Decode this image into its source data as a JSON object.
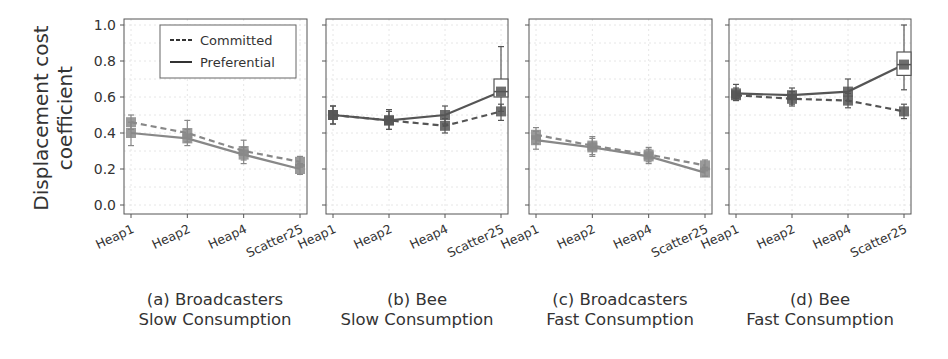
{
  "chart_data": [
    {
      "type": "line",
      "panel": "a",
      "caption_line1": "(a) Broadcasters",
      "caption_line2": "Slow Consumption",
      "categories": [
        "Heap1",
        "Heap2",
        "Heap4",
        "Scatter25"
      ],
      "ylabel": "Displacement cost coefficient",
      "ylim": [
        -0.05,
        1.03
      ],
      "yticks": [
        "0.0",
        "0.2",
        "0.4",
        "0.6",
        "0.8",
        "1.0"
      ],
      "grid": true,
      "legend": {
        "position": "upper right",
        "entries": [
          "Committed",
          "Preferential"
        ]
      },
      "color": "#888888",
      "series": [
        {
          "name": "Committed",
          "style": "dashed",
          "values": [
            0.46,
            0.4,
            0.3,
            0.24
          ],
          "err_low": [
            0.42,
            0.35,
            0.25,
            0.21
          ],
          "err_high": [
            0.5,
            0.47,
            0.36,
            0.27
          ]
        },
        {
          "name": "Preferential",
          "style": "solid",
          "values": [
            0.4,
            0.37,
            0.28,
            0.2
          ],
          "err_low": [
            0.33,
            0.33,
            0.23,
            0.17
          ],
          "err_high": [
            0.46,
            0.42,
            0.32,
            0.23
          ]
        }
      ]
    },
    {
      "type": "line",
      "panel": "b",
      "caption_line1": "(b) Bee",
      "caption_line2": "Slow Consumption",
      "categories": [
        "Heap1",
        "Heap2",
        "Heap4",
        "Scatter25"
      ],
      "ylim": [
        -0.05,
        1.03
      ],
      "grid": true,
      "color": "#555555",
      "series": [
        {
          "name": "Committed",
          "style": "dashed",
          "values": [
            0.5,
            0.47,
            0.44,
            0.52
          ],
          "err_low": [
            0.45,
            0.42,
            0.4,
            0.47
          ],
          "err_high": [
            0.55,
            0.52,
            0.48,
            0.56
          ]
        },
        {
          "name": "Preferential",
          "style": "solid",
          "values": [
            0.5,
            0.47,
            0.5,
            0.63
          ],
          "err_low": [
            0.45,
            0.42,
            0.45,
            0.52
          ],
          "err_high": [
            0.55,
            0.53,
            0.55,
            0.88
          ],
          "box": {
            "index": 3,
            "q1": 0.6,
            "q3": 0.7
          }
        }
      ]
    },
    {
      "type": "line",
      "panel": "c",
      "caption_line1": "(c) Broadcasters",
      "caption_line2": "Fast Consumption",
      "categories": [
        "Heap1",
        "Heap2",
        "Heap4",
        "Scatter25"
      ],
      "ylim": [
        -0.05,
        1.03
      ],
      "grid": true,
      "color": "#888888",
      "series": [
        {
          "name": "Committed",
          "style": "dashed",
          "values": [
            0.39,
            0.33,
            0.28,
            0.22
          ],
          "err_low": [
            0.34,
            0.28,
            0.24,
            0.19
          ],
          "err_high": [
            0.43,
            0.38,
            0.32,
            0.25
          ]
        },
        {
          "name": "Preferential",
          "style": "solid",
          "values": [
            0.36,
            0.32,
            0.27,
            0.18
          ],
          "err_low": [
            0.31,
            0.27,
            0.23,
            0.16
          ],
          "err_high": [
            0.41,
            0.37,
            0.31,
            0.21
          ]
        }
      ]
    },
    {
      "type": "line",
      "panel": "d",
      "caption_line1": "(d) Bee",
      "caption_line2": "Fast Consumption",
      "categories": [
        "Heap1",
        "Heap2",
        "Heap4",
        "Scatter25"
      ],
      "ylim": [
        -0.05,
        1.03
      ],
      "grid": true,
      "color": "#555555",
      "series": [
        {
          "name": "Committed",
          "style": "dashed",
          "values": [
            0.61,
            0.59,
            0.58,
            0.52
          ],
          "err_low": [
            0.58,
            0.55,
            0.54,
            0.48
          ],
          "err_high": [
            0.65,
            0.63,
            0.62,
            0.56
          ]
        },
        {
          "name": "Preferential",
          "style": "solid",
          "values": [
            0.62,
            0.61,
            0.63,
            0.78
          ],
          "err_low": [
            0.59,
            0.56,
            0.58,
            0.64
          ],
          "err_high": [
            0.67,
            0.65,
            0.7,
            1.0
          ],
          "box": {
            "index": 3,
            "q1": 0.72,
            "q3": 0.85
          }
        }
      ]
    }
  ],
  "figure": {
    "ylabel_line1": "Displacement cost",
    "ylabel_line2": "coefficient",
    "legend_committed": "Committed",
    "legend_preferential": "Preferential"
  }
}
